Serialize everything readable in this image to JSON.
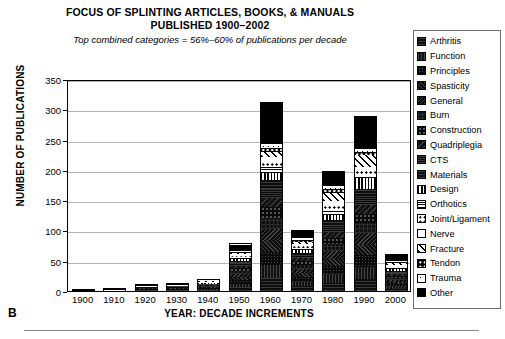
{
  "panel_letter": "B",
  "chart_data": {
    "type": "bar",
    "stacked": true,
    "title": "FOCUS OF SPLINTING ARTICLES, BOOKS, & MANUALS\nPUBLISHED 1900–2002",
    "subtitle": "Top combined categories = 56%–60% of publications per decade",
    "xlabel": "YEAR:  DECADE INCREMENTS",
    "ylabel": "NUMBER OF PUBLICATIONS",
    "ylim": [
      0,
      350
    ],
    "yticks": [
      0,
      50,
      100,
      150,
      200,
      250,
      300,
      350
    ],
    "grid": true,
    "legend_position": "right",
    "categories": [
      "1900",
      "1910",
      "1920",
      "1930",
      "1940",
      "1950",
      "1960",
      "1970",
      "1980",
      "1990",
      "2000"
    ],
    "totals": [
      1,
      3,
      10,
      12,
      19,
      77,
      310,
      99,
      196,
      288,
      60
    ],
    "series": [
      {
        "name": "Arthritis",
        "pattern": "p-dark1",
        "values": [
          0,
          0,
          1,
          1,
          2,
          6,
          22,
          8,
          14,
          20,
          4
        ]
      },
      {
        "name": "Function",
        "pattern": "p-dark2",
        "values": [
          0,
          0,
          1,
          1,
          2,
          6,
          22,
          8,
          14,
          20,
          4
        ]
      },
      {
        "name": "Principles",
        "pattern": "p-dark3",
        "values": [
          0,
          0,
          1,
          1,
          2,
          6,
          22,
          8,
          14,
          20,
          4
        ]
      },
      {
        "name": "Spasticity",
        "pattern": "p-dark4",
        "values": [
          0,
          0,
          1,
          1,
          1,
          5,
          20,
          7,
          12,
          18,
          4
        ]
      },
      {
        "name": "General",
        "pattern": "p-dark5",
        "values": [
          0,
          0,
          1,
          1,
          1,
          5,
          20,
          7,
          12,
          18,
          4
        ]
      },
      {
        "name": "Burn",
        "pattern": "p-dark6",
        "values": [
          0,
          0,
          1,
          1,
          1,
          5,
          18,
          6,
          11,
          16,
          3
        ]
      },
      {
        "name": "Construction",
        "pattern": "p-dark7",
        "values": [
          0,
          0,
          1,
          1,
          1,
          5,
          18,
          6,
          11,
          16,
          3
        ]
      },
      {
        "name": "Quadriplegia",
        "pattern": "p-dark8",
        "values": [
          0,
          0,
          1,
          1,
          1,
          4,
          16,
          5,
          10,
          14,
          3
        ]
      },
      {
        "name": "CTS",
        "pattern": "p-dark9",
        "values": [
          0,
          0,
          0,
          1,
          1,
          4,
          16,
          5,
          10,
          14,
          3
        ]
      },
      {
        "name": "Materials",
        "pattern": "p-dark1",
        "values": [
          0,
          0,
          0,
          1,
          1,
          4,
          14,
          5,
          9,
          12,
          3
        ]
      },
      {
        "name": "Design",
        "pattern": "p-vstripe",
        "values": [
          0,
          0,
          0,
          0,
          1,
          3,
          12,
          4,
          9,
          18,
          3
        ]
      },
      {
        "name": "Orthotics",
        "pattern": "p-checker",
        "values": [
          0,
          0,
          0,
          0,
          1,
          3,
          10,
          4,
          8,
          6,
          3
        ]
      },
      {
        "name": "Joint/Ligament",
        "pattern": "p-dotlight",
        "values": [
          0,
          0,
          0,
          0,
          1,
          3,
          10,
          4,
          8,
          8,
          3
        ]
      },
      {
        "name": "Nerve",
        "pattern": "p-white",
        "values": [
          0,
          0,
          0,
          0,
          1,
          2,
          8,
          3,
          7,
          5,
          2
        ]
      },
      {
        "name": "Fracture",
        "pattern": "p-diag",
        "values": [
          0,
          0,
          0,
          0,
          1,
          2,
          8,
          3,
          13,
          20,
          2
        ]
      },
      {
        "name": "Tendon",
        "pattern": "p-dotdark",
        "values": [
          0,
          0,
          0,
          0,
          1,
          2,
          8,
          3,
          6,
          5,
          2
        ]
      },
      {
        "name": "Trauma",
        "pattern": "p-dotwhite",
        "values": [
          0,
          1,
          1,
          1,
          1,
          2,
          6,
          3,
          5,
          4,
          2
        ]
      },
      {
        "name": "Other",
        "pattern": "p-solid",
        "values": [
          1,
          2,
          2,
          2,
          1,
          10,
          69,
          12,
          23,
          54,
          11
        ]
      }
    ]
  }
}
